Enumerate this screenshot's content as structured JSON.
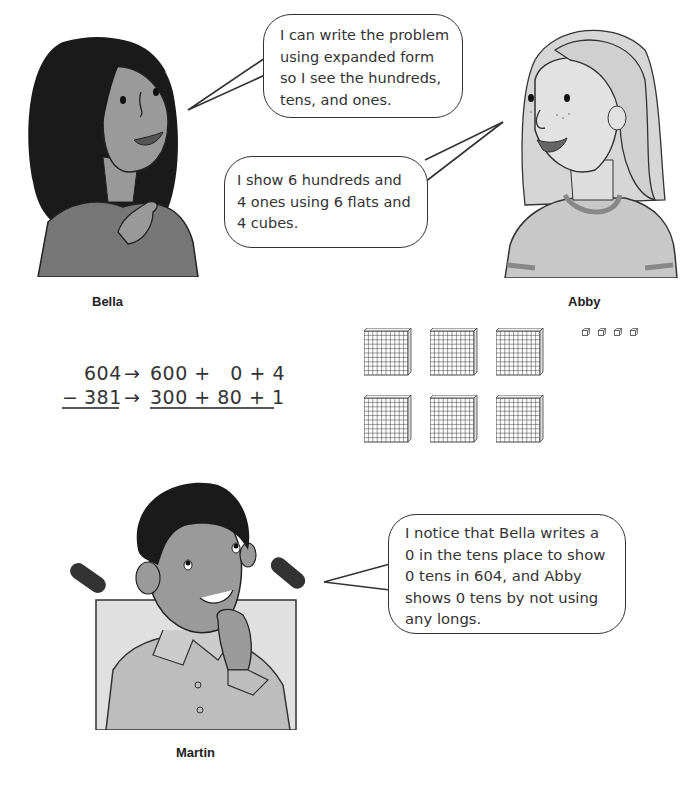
{
  "characters": [
    {
      "id": "bella",
      "name": "Bella",
      "hair": "dark, long",
      "pose": "pointing to self"
    },
    {
      "id": "abby",
      "name": "Abby",
      "hair": "light, shoulder-length",
      "pose": "smiling"
    },
    {
      "id": "martin",
      "name": "Martin",
      "pose": "hand on chin, in wheelchair"
    }
  ],
  "bubbles": {
    "bella": [
      "I can write the problem",
      "using expanded form",
      "so I see the hundreds,",
      "tens, and ones."
    ],
    "abby": [
      "I show 6 hundreds and",
      "4 ones using 6 flats and",
      "4 cubes."
    ],
    "martin": [
      "I notice that Bella writes a",
      "0 in the tens place to show",
      "0 tens in 604, and Abby",
      "shows 0 tens by not using",
      "any longs."
    ]
  },
  "expanded_form": {
    "row1": {
      "number": "604",
      "arrow": "→",
      "expansion": "600 +   0 + 4"
    },
    "row2": {
      "operator": "−",
      "number": "381",
      "arrow": "→",
      "expansion": "300 + 80 + 1"
    }
  },
  "base_ten_blocks": {
    "flats": 6,
    "longs": 0,
    "cubes": 4,
    "flat_grid": "10x10"
  }
}
